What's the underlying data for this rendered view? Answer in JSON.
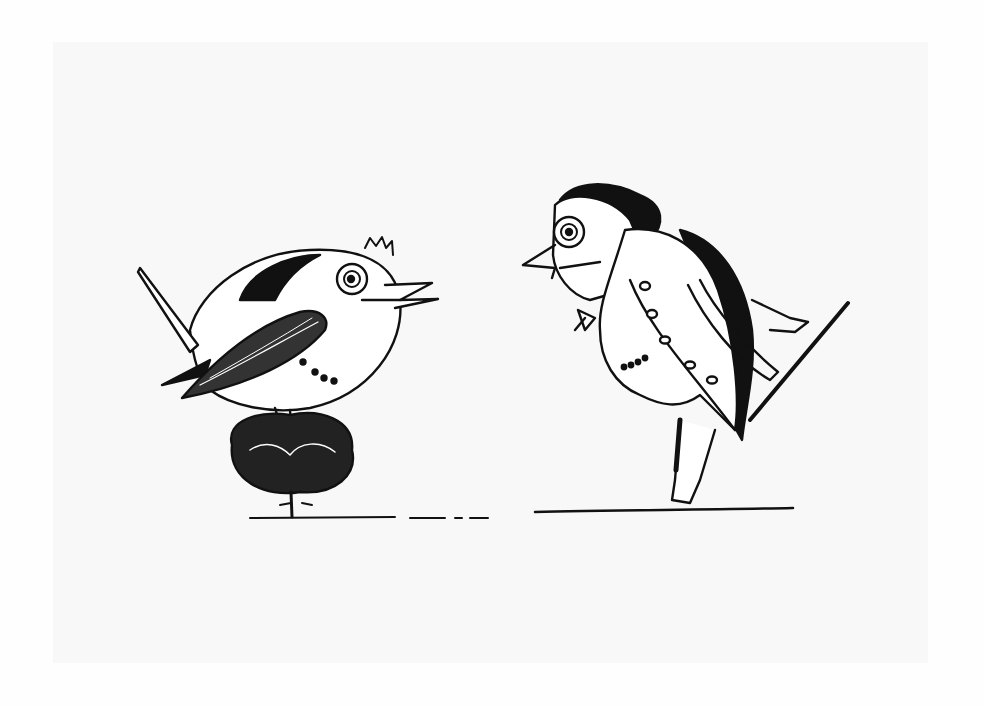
{
  "image": {
    "description": "Pen-and-ink illustration of two anthropomorphic birds facing each other",
    "colors": {
      "background": "#fefefe",
      "panel": "#f8f8f8",
      "ink": "#111111"
    },
    "figures": [
      {
        "name": "round-bird",
        "label": "Round wren-like bird perched on a small bush"
      },
      {
        "name": "coated-bird",
        "label": "Bird dressed in a tailcoat holding a cane"
      }
    ]
  }
}
